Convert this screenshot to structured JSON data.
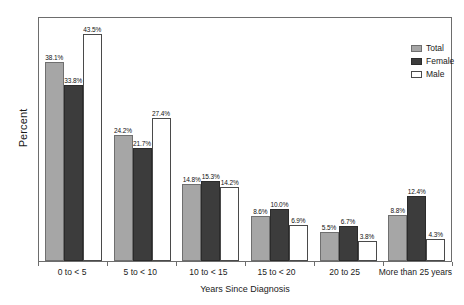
{
  "chart_data": {
    "type": "bar",
    "title": "",
    "xlabel": "Years Since Diagnosis",
    "ylabel": "Percent",
    "ylim": [
      0,
      47
    ],
    "grid": false,
    "legend_position": "top-right",
    "categories": [
      "0 to < 5",
      "5 to < 10",
      "10 to < 15",
      "15 to < 20",
      "20 to 25",
      "More than 25 years"
    ],
    "series": [
      {
        "name": "Total",
        "color": "#a6a6a6",
        "values": [
          38.1,
          24.2,
          14.8,
          8.6,
          5.5,
          8.8
        ],
        "labels": [
          "38.1%",
          "24.2%",
          "14.8%",
          "8.6%",
          "5.5%",
          "8.8%"
        ]
      },
      {
        "name": "Female",
        "color": "#3c3c3c",
        "values": [
          33.8,
          21.7,
          15.3,
          10.0,
          6.7,
          12.4
        ],
        "labels": [
          "33.8%",
          "21.7%",
          "15.3%",
          "10.0%",
          "6.7%",
          "12.4%"
        ]
      },
      {
        "name": "Male",
        "color": "#ffffff",
        "values": [
          43.5,
          27.4,
          14.2,
          6.9,
          3.8,
          4.3
        ],
        "labels": [
          "43.5%",
          "27.4%",
          "14.2%",
          "6.9%",
          "3.8%",
          "4.3%"
        ]
      }
    ]
  },
  "legend": {
    "items": [
      {
        "label": "Total"
      },
      {
        "label": "Female"
      },
      {
        "label": "Male"
      }
    ]
  },
  "axes": {
    "x_title": "Years Since Diagnosis",
    "y_title": "Percent",
    "x_categories": [
      "0 to < 5",
      "5 to < 10",
      "10 to < 15",
      "15 to < 20",
      "20 to 25",
      "More than 25 years"
    ]
  }
}
